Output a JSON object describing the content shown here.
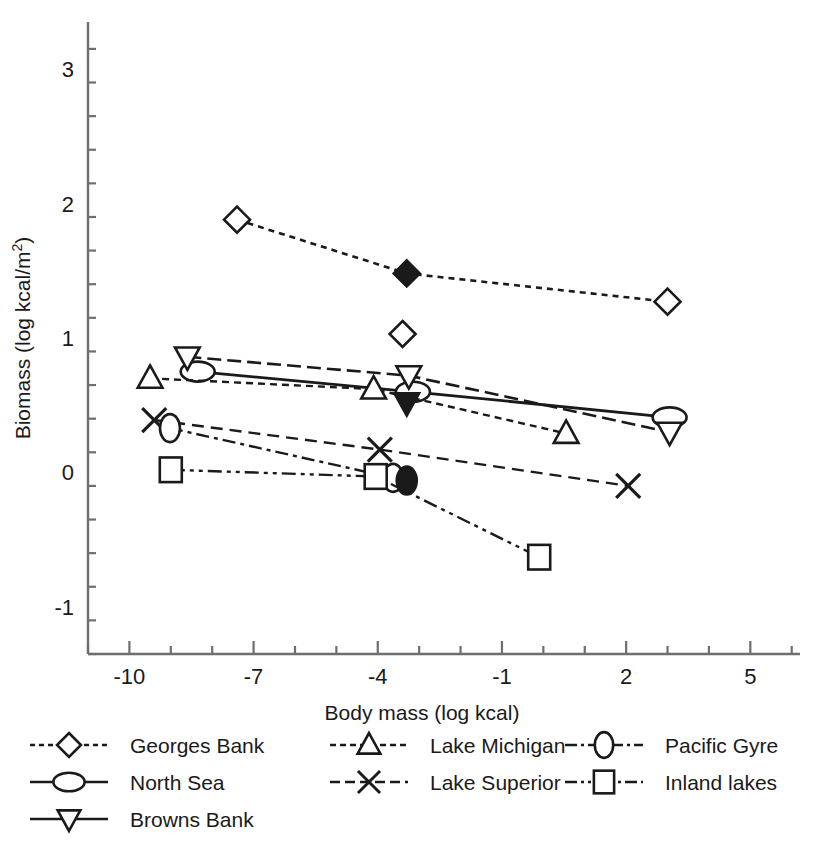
{
  "chart_data": {
    "type": "scatter",
    "title": "",
    "xlabel": "Body mass (log kcal)",
    "ylabel": "Biomass (log kcal/m2)",
    "ylabel_display": "Biomass (log kcal/m",
    "ylabel_superscript": "2",
    "ylabel_suffix": ")",
    "xlim": [
      -11.0,
      6.2
    ],
    "ylim": [
      -1.35,
      3.35
    ],
    "xticks": [
      -10,
      -7,
      -4,
      -1,
      2,
      5
    ],
    "xtick_labels": [
      "-10",
      "-7",
      "-4",
      "-1",
      "2",
      "5"
    ],
    "xminor_step": 1,
    "yticks": [
      -1,
      0,
      1,
      2,
      3
    ],
    "ytick_labels": [
      "-1",
      "0",
      "1",
      "2",
      "3"
    ],
    "yminor_step": 0.25,
    "grid": false,
    "legend_position": "below-plot",
    "series": [
      {
        "name": "Georges Bank",
        "marker": "diamond",
        "dash": "6,5",
        "stroke_width": 2.6,
        "x": [
          -7.4,
          -3.3,
          3.0
        ],
        "y": [
          1.88,
          1.48,
          1.27
        ],
        "filled": [
          false,
          true,
          false
        ],
        "extra_points": [
          {
            "x": -3.4,
            "y": 1.03,
            "marker": "diamond",
            "filled": false
          }
        ]
      },
      {
        "name": "North Sea",
        "marker": "ellipse",
        "dash": "none",
        "stroke_width": 2.8,
        "x": [
          -8.35,
          -3.15,
          3.05
        ],
        "y": [
          0.75,
          0.6,
          0.41
        ],
        "filled": [
          false,
          false,
          false
        ],
        "extra_points": []
      },
      {
        "name": "Browns Bank",
        "marker": "triangle-down",
        "dash": "14,6",
        "stroke_width": 2.6,
        "x": [
          -8.6,
          -3.25,
          3.05
        ],
        "y": [
          0.86,
          0.72,
          0.3
        ],
        "filled": [
          false,
          false,
          false
        ],
        "extra_points": [
          {
            "x": -3.3,
            "y": 0.52,
            "marker": "triangle-down",
            "filled": true
          }
        ]
      },
      {
        "name": "Lake Michigan",
        "marker": "triangle-up",
        "dash": "7,5",
        "stroke_width": 2.4,
        "x": [
          -9.5,
          -4.1,
          0.55
        ],
        "y": [
          0.7,
          0.62,
          0.29
        ],
        "filled": [
          false,
          false,
          false
        ],
        "extra_points": []
      },
      {
        "name": "Lake Superior",
        "marker": "cross",
        "dash": "12,7",
        "stroke_width": 2.4,
        "x": [
          -9.4,
          -3.95,
          2.05
        ],
        "y": [
          0.39,
          0.17,
          -0.1
        ],
        "filled": [
          false,
          false,
          false
        ],
        "extra_points": []
      },
      {
        "name": "Pacific Gyre",
        "marker": "ellipse-v",
        "dash": "13,5,4,5",
        "stroke_width": 2.4,
        "x": [
          -9.02,
          -3.63
        ],
        "y": [
          0.33,
          -0.04
        ],
        "filled": [
          false,
          false
        ],
        "extra_points": [
          {
            "x": -3.3,
            "y": -0.06,
            "marker": "ellipse-v",
            "filled": true
          }
        ]
      },
      {
        "name": "Inland lakes",
        "marker": "square",
        "dash": "14,5,4,5,4,5",
        "stroke_width": 2.4,
        "x": [
          -9.0,
          -4.05,
          -0.1
        ],
        "y": [
          0.02,
          -0.03,
          -0.63
        ],
        "filled": [
          false,
          false,
          false
        ],
        "extra_points": []
      }
    ]
  },
  "legend": {
    "columns": [
      [
        {
          "label": "Georges Bank",
          "marker": "diamond",
          "dash": "5,4"
        },
        {
          "label": "North Sea",
          "marker": "ellipse",
          "dash": "none"
        },
        {
          "label": "Browns Bank",
          "marker": "triangle-down",
          "dash": "none"
        }
      ],
      [
        {
          "label": "Lake Michigan",
          "marker": "triangle-up",
          "dash": "6,4"
        },
        {
          "label": "Lake Superior",
          "marker": "cross",
          "dash": "10,5"
        }
      ],
      [
        {
          "label": "Pacific Gyre",
          "marker": "ellipse-v",
          "dash": "12,4,3,4"
        },
        {
          "label": "Inland lakes",
          "marker": "square",
          "dash": "12,4,3,4,3,4"
        }
      ]
    ]
  },
  "colors": {
    "ink": "#1a1a1a",
    "axis": "#6e6e6e",
    "background": "#ffffff"
  }
}
